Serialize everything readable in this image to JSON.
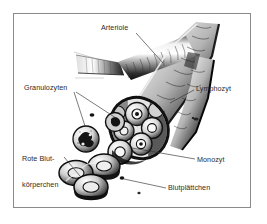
{
  "figure": {
    "language": "de",
    "background_color": "#ffffff",
    "frame_color": "#8a8a8a",
    "ink_color": "#1a1a1a",
    "text_color": "#2b2b2b"
  },
  "labels": {
    "arteriole": "Arteriole",
    "granulozyten": "Granulozyten",
    "rote_blutkoerperchen_line1": "Rote Blut-",
    "rote_blutkoerperchen_line2": "körperchen",
    "lymphozyt": "Lymphozyt",
    "monozyt": "Monozyt",
    "blutplaettchen": "Blutplättchen"
  },
  "structures": {
    "vessel": "arteriole-vessel",
    "vessel_branch_left": "capillary-branch",
    "vessel_branch_right": "descending-branch",
    "cut_end": "vessel-cut-opening",
    "granulocyte_free": "granulocyte-cell",
    "red_cells": "red-blood-cell-stack",
    "platelets": "platelet-dots"
  }
}
